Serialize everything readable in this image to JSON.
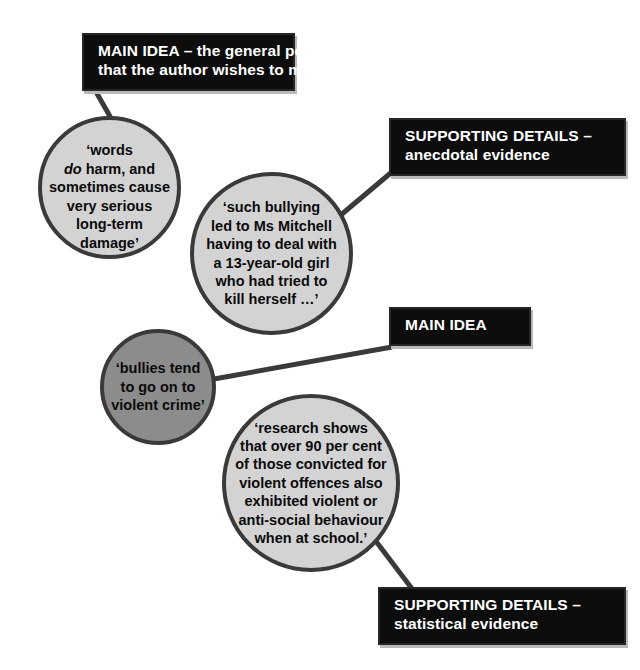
{
  "diagram": {
    "colors": {
      "box_fill": "#0d0d0d",
      "box_text": "#ffffff",
      "circle_light_fill": "#d3d3d3",
      "circle_dark_fill": "#8c8c8c",
      "circle_stroke": "#3a3a3a",
      "connector": "#3a3a3a",
      "background": "#ffffff"
    },
    "boxes": [
      {
        "id": "main-idea-1",
        "line1": "MAIN IDEA – the general point",
        "line2": "that the author wishes to make"
      },
      {
        "id": "supporting-details-1",
        "line1": "SUPPORTING DETAILS –",
        "line2": "anecdotal evidence"
      },
      {
        "id": "main-idea-2",
        "line1": "MAIN IDEA",
        "line2": ""
      },
      {
        "id": "supporting-details-2",
        "line1": "SUPPORTING DETAILS –",
        "line2": "statistical evidence"
      }
    ],
    "circles": [
      {
        "id": "words",
        "shade": "light",
        "pre": "‘words\n",
        "em": "do",
        "post": " harm, and\nsometimes cause\nvery serious\nlong-term\ndamage’",
        "text": "‘words do harm, and sometimes cause very serious long-term damage’"
      },
      {
        "id": "anecdote",
        "shade": "light",
        "text": "‘such bullying\nled to Ms Mitchell\nhaving to deal with\na 13-year-old girl\nwho had tried to\nkill herself …’"
      },
      {
        "id": "bullies",
        "shade": "dark",
        "text": "‘bullies tend\nto go on to\nviolent crime’"
      },
      {
        "id": "research",
        "shade": "light",
        "text": "‘research shows\nthat over 90 per cent\nof those convicted for\nviolent offences also\nexhibited violent or\nanti-social behaviour\nwhen at school.’"
      }
    ],
    "connectors": [
      {
        "id": "main-idea-1-to-words",
        "from": "main-idea-1",
        "to": "words"
      },
      {
        "id": "supporting-1-to-anecdote",
        "from": "supporting-details-1",
        "to": "anecdote"
      },
      {
        "id": "main-idea-2-to-bullies",
        "from": "main-idea-2",
        "to": "bullies"
      },
      {
        "id": "research-to-supporting-2",
        "from": "research",
        "to": "supporting-details-2"
      }
    ]
  }
}
